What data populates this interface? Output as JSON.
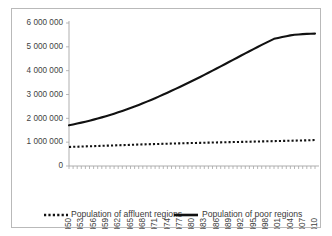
{
  "chart_data": {
    "type": "line",
    "title": "",
    "xlabel": "",
    "ylabel": "",
    "grid": false,
    "legend_position": "bottom",
    "ylim": [
      0,
      6000000
    ],
    "ytick_values": [
      0,
      1000000,
      2000000,
      3000000,
      4000000,
      5000000,
      6000000
    ],
    "ytick_labels": [
      "0",
      "1 000 000",
      "2 000 000",
      "3 000 000",
      "4 000 000",
      "5 000 000",
      "6 000 000"
    ],
    "xlim": [
      1950,
      2010
    ],
    "xtick_labels": [
      "1950",
      "1953",
      "1956",
      "1959",
      "1962",
      "1965",
      "1968",
      "1971",
      "1974",
      "1977",
      "1980",
      "1983",
      "1986",
      "1989",
      "1992",
      "1995",
      "1998",
      "2001",
      "2004",
      "2007",
      "2010"
    ],
    "xtick_label_interval": 3,
    "x": [
      1950,
      1951,
      1952,
      1953,
      1954,
      1955,
      1956,
      1957,
      1958,
      1959,
      1960,
      1961,
      1962,
      1963,
      1964,
      1965,
      1966,
      1967,
      1968,
      1969,
      1970,
      1971,
      1972,
      1973,
      1974,
      1975,
      1976,
      1977,
      1978,
      1979,
      1980,
      1981,
      1982,
      1983,
      1984,
      1985,
      1986,
      1987,
      1988,
      1989,
      1990,
      1991,
      1992,
      1993,
      1994,
      1995,
      1996,
      1997,
      1998,
      1999,
      2000,
      2001,
      2002,
      2003,
      2004,
      2005,
      2006,
      2007,
      2008,
      2009,
      2010
    ],
    "series": [
      {
        "name": "Population of affluent regions",
        "style": "dotted",
        "color": "#111111",
        "values": [
          800000,
          805000,
          810000,
          816000,
          822000,
          828000,
          834000,
          840000,
          846000,
          852000,
          858000,
          864000,
          870000,
          876000,
          882000,
          888000,
          894000,
          900000,
          906000,
          911000,
          916000,
          921000,
          926000,
          931000,
          936000,
          941000,
          946000,
          951000,
          956000,
          960000,
          964000,
          968000,
          972000,
          976000,
          980000,
          984000,
          988000,
          992000,
          996000,
          1000000,
          1004000,
          1008000,
          1012000,
          1016000,
          1020000,
          1024000,
          1028000,
          1032000,
          1036000,
          1040000,
          1044000,
          1048000,
          1052000,
          1056000,
          1060000,
          1064000,
          1068000,
          1072000,
          1078000,
          1084000,
          1090000
        ]
      },
      {
        "name": "Population of poor regions",
        "style": "solid",
        "color": "#111111",
        "values": [
          1710000,
          1745000,
          1782000,
          1820000,
          1860000,
          1902000,
          1946000,
          1992000,
          2040000,
          2090000,
          2142000,
          2196000,
          2252000,
          2310000,
          2370000,
          2432000,
          2496000,
          2562000,
          2630000,
          2700000,
          2772000,
          2846000,
          2921000,
          2998000,
          3076000,
          3155000,
          3235000,
          3316000,
          3398000,
          3481000,
          3565000,
          3650000,
          3736000,
          3823000,
          3911000,
          4000000,
          4090000,
          4180000,
          4271000,
          4362000,
          4453000,
          4544000,
          4635000,
          4726000,
          4816000,
          4905000,
          4993000,
          5080000,
          5166000,
          5251000,
          5335000,
          5375000,
          5412000,
          5448000,
          5482000,
          5504000,
          5520000,
          5534000,
          5542000,
          5550000,
          5555000
        ]
      }
    ]
  },
  "legend": {
    "items": [
      {
        "label": "Population of affluent regions",
        "style": "dotted"
      },
      {
        "label": "Population of poor regions",
        "style": "solid"
      }
    ]
  }
}
